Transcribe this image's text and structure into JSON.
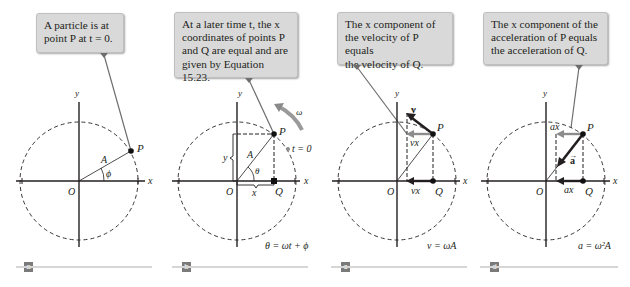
{
  "panels": [
    {
      "id": "a",
      "tag": "a",
      "callout_lines": [
        "A particle is at",
        "point P at t = 0."
      ],
      "labels": {
        "x": "x",
        "y": "y",
        "origin": "O",
        "P": "P",
        "A": "A",
        "phi": "ϕ"
      },
      "equation": ""
    },
    {
      "id": "b",
      "tag": "b",
      "callout_lines": [
        "At a later time t, the x",
        "coordinates of points P",
        "and Q are equal and are",
        "given by Equation 15.23."
      ],
      "labels": {
        "x": "x",
        "y": "y",
        "origin": "O",
        "P": "P",
        "Q": "Q",
        "A": "A",
        "theta": "θ",
        "omega": "ω",
        "t0": "t = 0",
        "xcomp": "x",
        "ycomp": "y"
      },
      "equation": "θ = ωt + ϕ"
    },
    {
      "id": "c",
      "tag": "c",
      "callout_lines": [
        "The x component of",
        "the velocity of P equals",
        "the velocity of Q."
      ],
      "labels": {
        "x": "x",
        "y": "y",
        "origin": "O",
        "P": "P",
        "Q": "Q",
        "v": "v",
        "vx_top": "vx",
        "vx_bottom": "vx"
      },
      "equation": "v = ωA"
    },
    {
      "id": "d",
      "tag": "d",
      "callout_lines": [
        "The x component of the",
        "acceleration of P equals",
        "the acceleration of Q."
      ],
      "labels": {
        "x": "x",
        "y": "y",
        "origin": "O",
        "P": "P",
        "Q": "Q",
        "a": "a",
        "ax_top": "ax",
        "ax_bottom": "ax"
      },
      "equation": "a = ω²A"
    }
  ],
  "colors": {
    "callout_bg": "#d9d9d9",
    "line": "#231f20",
    "gray_arrow": "#8c8c8c",
    "leader": "#6e6e6e",
    "omega_arrow": "#9a9a9a",
    "tag_bg": "#7a7a7a"
  }
}
